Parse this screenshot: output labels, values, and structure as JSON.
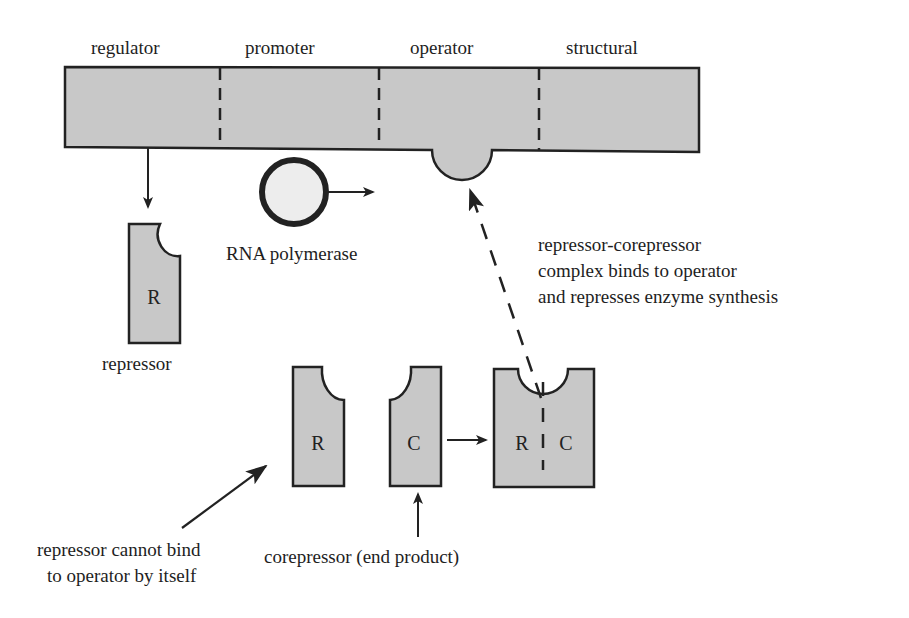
{
  "gene_segments": [
    "regulator",
    "promoter",
    "operator",
    "structural"
  ],
  "labels": {
    "rna_polymerase": "RNA polymerase",
    "repressor": "repressor",
    "complex_note": [
      "repressor-corepressor",
      "complex binds to operator",
      "and represses enzyme synthesis"
    ],
    "cannot_bind_note": [
      "repressor cannot bind",
      "to operator by itself"
    ],
    "corepressor_note": "corepressor (end product)"
  },
  "shapes": {
    "repressor_letter": "R",
    "corepressor_letter": "C",
    "complex_letters": [
      "R",
      "C"
    ]
  },
  "colors": {
    "fill": "#c8c8c8",
    "stroke": "#222222"
  }
}
